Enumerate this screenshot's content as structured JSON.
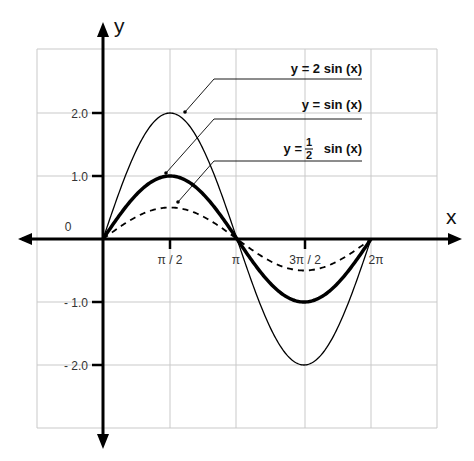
{
  "chart_data": {
    "type": "line",
    "title": "",
    "xlabel": "x",
    "ylabel": "y",
    "xlim": [
      -1.5708,
      5.236
    ],
    "ylim": [
      -3.0,
      3.0
    ],
    "grid": true,
    "x_ticks": [
      {
        "value": 1.5708,
        "label": "π / 2"
      },
      {
        "value": 3.1416,
        "label": "π"
      },
      {
        "value": 4.7124,
        "label": "3π / 2"
      },
      {
        "value": 6.2832,
        "label": "2π"
      }
    ],
    "y_ticks": [
      {
        "value": 2.0,
        "label": "2.0"
      },
      {
        "value": 1.0,
        "label": "1.0"
      },
      {
        "value": 0,
        "label": "0"
      },
      {
        "value": -1.0,
        "label": "- 1.0"
      },
      {
        "value": -2.0,
        "label": "- 2.0"
      }
    ],
    "x_domain": [
      0,
      6.2832
    ],
    "series": [
      {
        "name": "y = 2 sin (x)",
        "amplitude": 2,
        "style": "thin",
        "x": [
          0,
          1.5708,
          3.1416,
          4.7124,
          6.2832
        ],
        "values": [
          0,
          2,
          0,
          -2,
          0
        ]
      },
      {
        "name": "y = sin (x)",
        "amplitude": 1,
        "style": "bold",
        "x": [
          0,
          1.5708,
          3.1416,
          4.7124,
          6.2832
        ],
        "values": [
          0,
          1,
          0,
          -1,
          0
        ]
      },
      {
        "name": "y = 1/2 sin (x)",
        "amplitude": 0.5,
        "style": "dashed",
        "x": [
          0,
          1.5708,
          3.1416,
          4.7124,
          6.2832
        ],
        "values": [
          0,
          0.5,
          0,
          -0.5,
          0
        ]
      }
    ],
    "legend": [
      {
        "label": "y = 2 sin (x)",
        "prefix": "y =",
        "fraction": null,
        "suffix": "2 sin (x)"
      },
      {
        "label": "y = sin (x)",
        "prefix": "y =",
        "fraction": null,
        "suffix": "sin (x)"
      },
      {
        "label": "y = ½ sin (x)",
        "prefix": "y =",
        "fraction": {
          "num": "1",
          "den": "2"
        },
        "suffix": "sin (x)"
      }
    ],
    "legend_position": "upper right, callout lines"
  },
  "labels": {
    "x_axis": "x",
    "y_axis": "y",
    "origin": "0",
    "legend_1": "y = 2 sin (x)",
    "legend_2": "y = sin (x)",
    "legend_3_prefix": "y =",
    "legend_3_num": "1",
    "legend_3_den": "2",
    "legend_3_suffix": "sin (x)",
    "xt_1": "π / 2",
    "xt_2": "π",
    "xt_3": "3π / 2",
    "xt_4": "2π",
    "yt_1": "2.0",
    "yt_2": "1.0",
    "yt_3": "- 1.0",
    "yt_4": "- 2.0"
  },
  "colors": {
    "axis": "#000000",
    "grid": "#c8c8c8",
    "curve": "#000000",
    "text": "#222222"
  }
}
